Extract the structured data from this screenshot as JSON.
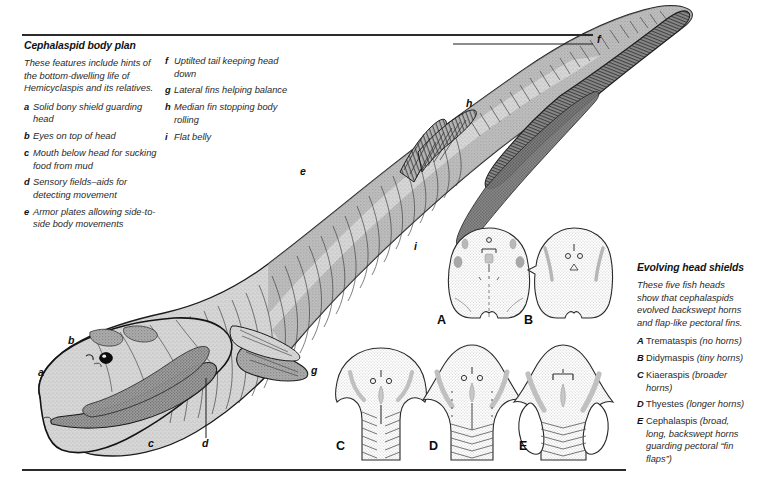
{
  "figure": {
    "background": "#ffffff",
    "rule_color": "#2b2b2b",
    "body_fill": "#d3d3d3",
    "body_dark": "#8c8c8c",
    "outline": "#1a1a1a"
  },
  "left_panel": {
    "heading": "Cephalaspid body plan",
    "intro": "These features include hints of the bottom-dwelling life of Hemicyclaspis and its relatives.",
    "intro_sci": "Hemicyclaspis",
    "items": [
      {
        "key": "a",
        "text": "Solid bony shield guarding head"
      },
      {
        "key": "b",
        "text": "Eyes on top of head"
      },
      {
        "key": "c",
        "text": "Mouth below head for sucking food from mud"
      },
      {
        "key": "d",
        "text": "Sensory fields–aids for detecting movement"
      },
      {
        "key": "e",
        "text": "Armor plates allowing side-to-side body movements"
      }
    ]
  },
  "mid_panel": {
    "items": [
      {
        "key": "f",
        "text": "Uptilted tail keeping head down"
      },
      {
        "key": "g",
        "text": "Lateral fins helping balance"
      },
      {
        "key": "h",
        "text": "Median fin stopping body rolling"
      },
      {
        "key": "i",
        "text": "Flat belly"
      }
    ]
  },
  "right_panel": {
    "heading": "Evolving head shields",
    "intro": "These five fish heads show that cephalaspids evolved backswept horns and flap-like pectoral fins.",
    "items": [
      {
        "key": "A",
        "name": "Tremataspis",
        "note": "(no horns)"
      },
      {
        "key": "B",
        "name": "Didymaspis",
        "note": "(tiny horns)"
      },
      {
        "key": "C",
        "name": "Kiaeraspis",
        "note": "(broader horns)"
      },
      {
        "key": "D",
        "name": "Thyestes",
        "note": "(longer horns)"
      },
      {
        "key": "E",
        "name": "Cephalaspis",
        "note": "(broad, long, backswept horns guarding pectoral “fin flaps”)"
      }
    ]
  },
  "fish_labels": [
    {
      "key": "a",
      "x": 38,
      "y": 373
    },
    {
      "key": "b",
      "x": 68,
      "y": 341
    },
    {
      "key": "c",
      "x": 148,
      "y": 444
    },
    {
      "key": "d",
      "x": 202,
      "y": 444
    },
    {
      "key": "e",
      "x": 300,
      "y": 172
    },
    {
      "key": "f",
      "x": 598,
      "y": 40
    },
    {
      "key": "g",
      "x": 311,
      "y": 371
    },
    {
      "key": "h",
      "x": 466,
      "y": 104
    },
    {
      "key": "i",
      "x": 414,
      "y": 247
    }
  ],
  "shield_labels": [
    {
      "key": "A",
      "x": 470,
      "y": 320
    },
    {
      "key": "B",
      "x": 554,
      "y": 320
    },
    {
      "key": "C",
      "x": 339,
      "y": 448
    },
    {
      "key": "D",
      "x": 432,
      "y": 448
    },
    {
      "key": "E",
      "x": 522,
      "y": 448
    }
  ]
}
